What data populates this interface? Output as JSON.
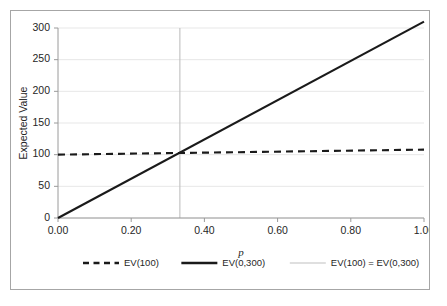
{
  "chart_data": {
    "type": "line",
    "title": "",
    "xlabel": "p",
    "ylabel": "Expected Value",
    "xlim": [
      0.0,
      1.0
    ],
    "ylim": [
      0,
      300
    ],
    "grid": true,
    "legend_position": "bottom",
    "x_tick_labels": [
      "0.00",
      "0.20",
      "0.40",
      "0.60",
      "0.80",
      "1.00"
    ],
    "x_tick_values": [
      0.0,
      0.2,
      0.4,
      0.6,
      0.8,
      1.0
    ],
    "y_tick_labels": [
      "0",
      "50",
      "100",
      "150",
      "200",
      "250",
      "300"
    ],
    "y_tick_values": [
      0,
      50,
      100,
      150,
      200,
      250,
      300
    ],
    "series": [
      {
        "name": "EV(100)",
        "style": "dashed",
        "color": "#1a1a1a",
        "x": [
          0.0,
          1.0
        ],
        "values": [
          100,
          108
        ]
      },
      {
        "name": "EV(0,300)",
        "style": "solid",
        "color": "#1a1a1a",
        "x": [
          0.0,
          1.0
        ],
        "values": [
          0,
          310
        ]
      },
      {
        "name": "EV(100) = EV(0,300)",
        "style": "vertical-line",
        "color": "#bfbfbf",
        "x": [
          0.333,
          0.333
        ],
        "values": [
          0,
          300
        ]
      }
    ],
    "annotations": [
      {
        "text": "",
        "type": "intersection-marker",
        "x": 0.333,
        "y": 100
      }
    ]
  },
  "legend": {
    "entries": [
      {
        "label": "EV(100)",
        "style": "dashed"
      },
      {
        "label": "EV(0,300)",
        "style": "solid"
      },
      {
        "label": "EV(100) = EV(0,300)",
        "style": "thin"
      }
    ]
  },
  "colors": {
    "series_dark": "#1a1a1a",
    "vertical_line": "#bfbfbf",
    "gridline": "#e4e4e4",
    "axis": "#9a9a9a",
    "border": "#a6a6a6",
    "background": "#ffffff",
    "text": "#262626"
  }
}
